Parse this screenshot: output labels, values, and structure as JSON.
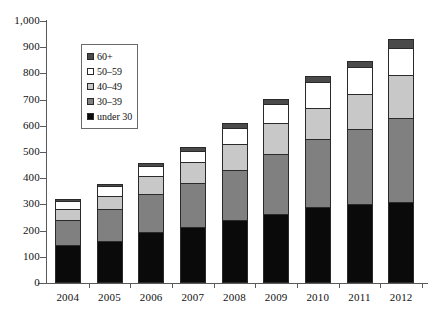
{
  "chart_data": {
    "type": "bar",
    "stacked": true,
    "title": "",
    "subtitle": "",
    "xlabel": "",
    "ylabel": "",
    "grid": false,
    "legend_position": "inside-top-left",
    "ylim": [
      0,
      1000
    ],
    "ytick_step": 100,
    "ytick_labels": [
      "1,000",
      "900",
      "800",
      "700",
      "600",
      "500",
      "400",
      "300",
      "200",
      "100",
      "0"
    ],
    "ytick_values": [
      1000,
      900,
      800,
      700,
      600,
      500,
      400,
      300,
      200,
      100,
      0
    ],
    "categories": [
      "2004",
      "2005",
      "2006",
      "2007",
      "2008",
      "2009",
      "2010",
      "2011",
      "2012"
    ],
    "series": [
      {
        "name": "under 30",
        "color": "#0a0a0a",
        "values": [
          145,
          160,
          195,
          215,
          240,
          265,
          290,
          300,
          310
        ]
      },
      {
        "name": "30–39",
        "color": "#808080",
        "values": [
          100,
          125,
          150,
          170,
          195,
          230,
          265,
          290,
          325
        ]
      },
      {
        "name": "40–49",
        "color": "#c8c8c8",
        "values": [
          45,
          55,
          70,
          85,
          105,
          125,
          120,
          140,
          165
        ]
      },
      {
        "name": "50–59",
        "color": "#ffffff",
        "values": [
          35,
          40,
          45,
          45,
          65,
          75,
          105,
          105,
          110
        ]
      },
      {
        "name": "60+",
        "color": "#4a4a4a",
        "values": [
          10,
          12,
          15,
          18,
          20,
          22,
          25,
          28,
          35
        ]
      }
    ],
    "totals": [
      335,
      392,
      475,
      533,
      625,
      717,
      805,
      863,
      945
    ],
    "legend_entries": [
      "60+",
      "50–59",
      "40–49",
      "30–39",
      "under 30"
    ],
    "legend_colors": [
      "#4a4a4a",
      "#ffffff",
      "#c8c8c8",
      "#808080",
      "#0a0a0a"
    ]
  }
}
